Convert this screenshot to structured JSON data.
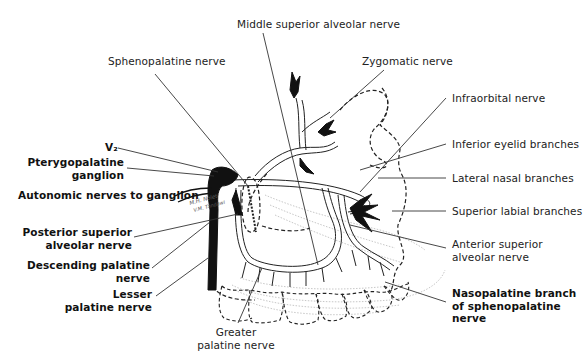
{
  "diagram": {
    "type": "anatomical-illustration",
    "signature": "M.H. Nolet / V.M. Tandawi",
    "labels": {
      "middle_superior_alveolar": "Middle superior alveolar nerve",
      "sphenopalatine": "Sphenopalatine nerve",
      "zygomatic": "Zygomatic nerve",
      "infraorbital": "Infraorbital nerve",
      "v2": "V₂",
      "inferior_eyelid": "Inferior eyelid branches",
      "pterygopalatine_1": "Pterygopalatine",
      "pterygopalatine_2": "ganglion",
      "lateral_nasal": "Lateral nasal branches",
      "autonomic": "Autonomic nerves to ganglion",
      "superior_labial": "Superior labial branches",
      "posterior_superior_1": "Posterior superior",
      "posterior_superior_2": "alveolar nerve",
      "anterior_superior_1": "Anterior superior",
      "anterior_superior_2": "alveolar nerve",
      "descending_palatine_1": "Descending palatine",
      "descending_palatine_2": "nerve",
      "lesser_palatine_1": "Lesser",
      "lesser_palatine_2": "palatine nerve",
      "nasopalatine_1": "Nasopalatine branch",
      "nasopalatine_2": "of sphenopalatine",
      "nasopalatine_3": "nerve",
      "greater_palatine_1": "Greater",
      "greater_palatine_2": "palatine nerve"
    },
    "colors": {
      "ink": "#111111",
      "leader": "#333333",
      "stipple": "#bbbbbb"
    }
  }
}
